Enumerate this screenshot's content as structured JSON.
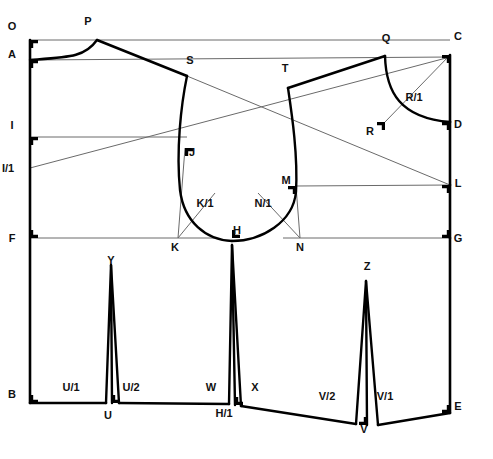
{
  "diagram": {
    "type": "technical-pattern-drafting",
    "stroke_color": "#000000",
    "thin_stroke_color": "#6a6a6a",
    "background_color": "#ffffff",
    "canvas": {
      "width": 493,
      "height": 459
    },
    "points": [
      {
        "id": "O",
        "label": "O",
        "x": 12,
        "y": 30,
        "corner_x": 30,
        "corner_y": 40,
        "square": true
      },
      {
        "id": "P",
        "label": "P",
        "x": 88,
        "y": 25,
        "corner_x": 97,
        "corner_y": 40,
        "square": false
      },
      {
        "id": "A",
        "label": "A",
        "x": 12,
        "y": 58,
        "corner_x": 30,
        "corner_y": 60,
        "square": true
      },
      {
        "id": "S",
        "label": "S",
        "x": 190,
        "y": 64,
        "corner_x": 187,
        "corner_y": 76,
        "square": false
      },
      {
        "id": "T",
        "label": "T",
        "x": 285,
        "y": 72,
        "corner_x": 288,
        "corner_y": 88,
        "square": false
      },
      {
        "id": "Q",
        "label": "Q",
        "x": 386,
        "y": 42,
        "corner_x": 385,
        "corner_y": 56,
        "square": false
      },
      {
        "id": "C",
        "label": "C",
        "x": 458,
        "y": 40,
        "corner_x": 450,
        "corner_y": 55,
        "square": true
      },
      {
        "id": "R/1",
        "label": "R/1",
        "x": 414,
        "y": 101,
        "corner_x": 0,
        "corner_y": 0,
        "square": false
      },
      {
        "id": "R",
        "label": "R",
        "x": 370,
        "y": 135,
        "corner_x": 385,
        "corner_y": 122,
        "square": true
      },
      {
        "id": "D",
        "label": "D",
        "x": 458,
        "y": 128,
        "corner_x": 450,
        "corner_y": 122,
        "square": true
      },
      {
        "id": "I",
        "label": "I",
        "x": 12,
        "y": 129,
        "corner_x": 30,
        "corner_y": 137,
        "square": true
      },
      {
        "id": "J",
        "label": "J",
        "x": 192,
        "y": 156,
        "corner_x": 185,
        "corner_y": 148,
        "square": true
      },
      {
        "id": "I/1",
        "label": "I/1",
        "x": 8,
        "y": 172,
        "corner_x": 30,
        "corner_y": 168,
        "square": false
      },
      {
        "id": "L",
        "label": "L",
        "x": 458,
        "y": 187,
        "corner_x": 450,
        "corner_y": 185,
        "square": true
      },
      {
        "id": "M",
        "label": "M",
        "x": 286,
        "y": 184,
        "corner_x": 296,
        "corner_y": 186,
        "square": true
      },
      {
        "id": "K/1",
        "label": "K/1",
        "x": 205,
        "y": 207,
        "corner_x": 0,
        "corner_y": 0,
        "square": false
      },
      {
        "id": "N/1",
        "label": "N/1",
        "x": 263,
        "y": 207,
        "corner_x": 0,
        "corner_y": 0,
        "square": false
      },
      {
        "id": "F",
        "label": "F",
        "x": 12,
        "y": 242,
        "corner_x": 30,
        "corner_y": 238,
        "square": true
      },
      {
        "id": "K",
        "label": "K",
        "x": 175,
        "y": 251,
        "corner_x": 178,
        "corner_y": 238,
        "square": false
      },
      {
        "id": "H",
        "label": "H",
        "x": 237,
        "y": 234,
        "corner_x": 232,
        "corner_y": 238,
        "square": true
      },
      {
        "id": "N",
        "label": "N",
        "x": 300,
        "y": 251,
        "corner_x": 300,
        "corner_y": 238,
        "square": false
      },
      {
        "id": "G",
        "label": "G",
        "x": 458,
        "y": 242,
        "corner_x": 450,
        "corner_y": 238,
        "square": true
      },
      {
        "id": "Y",
        "label": "Y",
        "x": 111,
        "y": 264,
        "corner_x": 0,
        "corner_y": 0,
        "square": false
      },
      {
        "id": "Z",
        "label": "Z",
        "x": 367,
        "y": 270,
        "corner_x": 0,
        "corner_y": 0,
        "square": false
      },
      {
        "id": "B",
        "label": "B",
        "x": 12,
        "y": 398,
        "corner_x": 30,
        "corner_y": 403,
        "square": true
      },
      {
        "id": "U/1",
        "label": "U/1",
        "x": 71,
        "y": 391,
        "corner_x": 0,
        "corner_y": 0,
        "square": false
      },
      {
        "id": "U/2",
        "label": "U/2",
        "x": 131,
        "y": 391,
        "corner_x": 0,
        "corner_y": 0,
        "square": false
      },
      {
        "id": "U",
        "label": "U",
        "x": 108,
        "y": 419,
        "corner_x": 112,
        "corner_y": 403,
        "square": true
      },
      {
        "id": "W",
        "label": "W",
        "x": 211,
        "y": 391,
        "corner_x": 0,
        "corner_y": 0,
        "square": false
      },
      {
        "id": "X",
        "label": "X",
        "x": 255,
        "y": 391,
        "corner_x": 0,
        "corner_y": 0,
        "square": false
      },
      {
        "id": "H/1",
        "label": "H/1",
        "x": 224,
        "y": 417,
        "corner_x": 235,
        "corner_y": 405,
        "square": true
      },
      {
        "id": "V/2",
        "label": "V/2",
        "x": 327,
        "y": 400,
        "corner_x": 0,
        "corner_y": 0,
        "square": false
      },
      {
        "id": "V/1",
        "label": "V/1",
        "x": 385,
        "y": 400,
        "corner_x": 0,
        "corner_y": 0,
        "square": false
      },
      {
        "id": "V",
        "label": "V",
        "x": 364,
        "y": 433,
        "corner_x": 367,
        "corner_y": 425,
        "square": true
      },
      {
        "id": "E",
        "label": "E",
        "x": 458,
        "y": 410,
        "corner_x": 450,
        "corner_y": 413,
        "square": true
      }
    ],
    "construction_lines": [
      {
        "name": "top-line-O-to-C",
        "from": [
          30,
          40
        ],
        "to": [
          450,
          40
        ]
      },
      {
        "name": "chest-line-A-to-C",
        "from": [
          30,
          60
        ],
        "to": [
          450,
          57
        ]
      },
      {
        "name": "bust-line-I-to-J",
        "from": [
          30,
          137
        ],
        "to": [
          187,
          137
        ]
      },
      {
        "name": "waist-line-M-to-L",
        "from": [
          296,
          186
        ],
        "to": [
          450,
          185
        ]
      },
      {
        "name": "hip-line-F-to-K",
        "from": [
          30,
          238
        ],
        "to": [
          215,
          238
        ]
      },
      {
        "name": "hip-line-N-to-G",
        "from": [
          283,
          238
        ],
        "to": [
          450,
          238
        ]
      },
      {
        "name": "diag-I1-to-C",
        "from": [
          30,
          168
        ],
        "to": [
          450,
          57
        ]
      },
      {
        "name": "diag-S-to-L",
        "from": [
          187,
          76
        ],
        "to": [
          450,
          185
        ]
      },
      {
        "name": "diag-R-to-C",
        "from": [
          385,
          122
        ],
        "to": [
          450,
          55
        ]
      },
      {
        "name": "dart-K-to-K1",
        "from": [
          178,
          238
        ],
        "to": [
          215,
          193
        ]
      },
      {
        "name": "dart-N-to-N1",
        "from": [
          300,
          238
        ],
        "to": [
          258,
          193
        ]
      },
      {
        "name": "dart-J-vertical",
        "from": [
          178,
          238
        ],
        "to": [
          185,
          148
        ]
      },
      {
        "name": "dart-M-vertical",
        "from": [
          300,
          238
        ],
        "to": [
          296,
          186
        ]
      },
      {
        "name": "dart-Y-center",
        "from": [
          111,
          275
        ],
        "to": [
          112,
          403
        ]
      },
      {
        "name": "dart-H-center",
        "from": [
          232,
          245
        ],
        "to": [
          235,
          405
        ]
      },
      {
        "name": "dart-Z-center",
        "from": [
          366,
          281
        ],
        "to": [
          367,
          425
        ]
      }
    ],
    "heavy_outline": [
      {
        "name": "center-back-O-to-B",
        "from": [
          30,
          40
        ],
        "to": [
          30,
          403
        ]
      },
      {
        "name": "shoulder-P-to-S",
        "from": [
          97,
          40
        ],
        "to": [
          187,
          76
        ]
      },
      {
        "name": "shoulder-Q-to-T",
        "from": [
          385,
          56
        ],
        "to": [
          288,
          88
        ]
      },
      {
        "name": "side-seam-right-C-D",
        "from": [
          450,
          55
        ],
        "to": [
          450,
          122
        ]
      },
      {
        "name": "side-seam-right-D-L",
        "from": [
          450,
          122
        ],
        "to": [
          450,
          185
        ]
      },
      {
        "name": "side-seam-right-L-G",
        "from": [
          450,
          185
        ],
        "to": [
          450,
          238
        ]
      },
      {
        "name": "side-seam-right-G-E",
        "from": [
          450,
          238
        ],
        "to": [
          450,
          413
        ]
      },
      {
        "name": "hem-B-to-U",
        "from": [
          30,
          403
        ],
        "to": [
          106,
          403
        ]
      },
      {
        "name": "hem-U-to-H1",
        "from": [
          119,
          403
        ],
        "to": [
          229,
          404
        ]
      },
      {
        "name": "hem-H1-to-V2",
        "from": [
          241,
          406
        ],
        "to": [
          356,
          424
        ]
      },
      {
        "name": "hem-V-to-E",
        "from": [
          378,
          425
        ],
        "to": [
          450,
          413
        ]
      }
    ],
    "curves": [
      {
        "name": "neckline-A-to-P",
        "path": "M 30,60 C 70,57 85,57 97,40"
      },
      {
        "name": "armhole-left",
        "path": "M 187,76 C 181,105 176,150 180,190 C 184,222 206,240 232,241"
      },
      {
        "name": "armhole-right",
        "path": "M 288,88 C 292,115 298,155 296,192 C 293,222 262,241 232,241"
      },
      {
        "name": "sleevehead-Q-R-D",
        "path": "M 385,56 C 386,92 400,118 450,122"
      },
      {
        "name": "dart-Y-left",
        "path": "M 106,403 L 111,265 L 112,403"
      },
      {
        "name": "dart-Y-right",
        "path": "M 111,265 L 119,403"
      },
      {
        "name": "dart-H-left",
        "path": "M 229,404 L 232,245 L 235,405"
      },
      {
        "name": "dart-H-right",
        "path": "M 232,245 L 241,406"
      },
      {
        "name": "dart-Z-left",
        "path": "M 356,424 L 366,281 L 367,425"
      },
      {
        "name": "dart-Z-right",
        "path": "M 366,281 L 378,425"
      }
    ]
  }
}
